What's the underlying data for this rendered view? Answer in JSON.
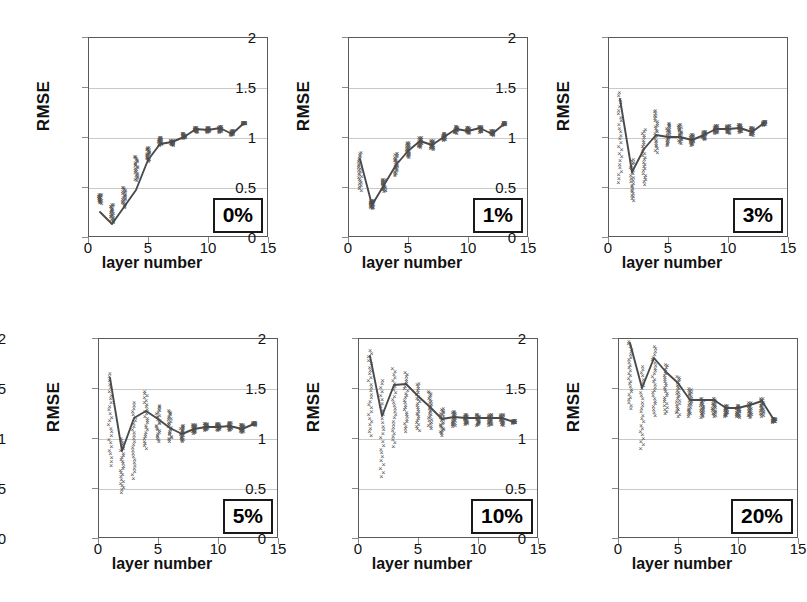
{
  "figure": {
    "axis_titles": {
      "y": "RMSE",
      "x": "layer number"
    },
    "y_ticks": [
      "0",
      "0.5",
      "1",
      "1.5",
      "2"
    ],
    "x_ticks": [
      "0",
      "5",
      "10",
      "15"
    ],
    "colors": {
      "frame": "#5a5a5a",
      "grid": "#c9c9c9",
      "marker": "#555555",
      "line": "#4a4a4a",
      "badge_border": "#1a1a1a"
    }
  },
  "chart_data": [
    {
      "type": "scatter",
      "title": "0%",
      "xlabel": "layer number",
      "ylabel": "RMSE",
      "xlim": [
        0,
        15
      ],
      "ylim": [
        0,
        2
      ],
      "xticks": [
        0,
        5,
        10,
        15
      ],
      "yticks": [
        0,
        0.5,
        1,
        1.5,
        2
      ],
      "grid": true,
      "legend": "none",
      "x": [
        1,
        2,
        3,
        4,
        5,
        6,
        7,
        8,
        9,
        10,
        11,
        12,
        13
      ],
      "mean_values": [
        0.25,
        0.13,
        0.3,
        0.47,
        0.77,
        0.93,
        0.95,
        1.0,
        1.08,
        1.07,
        1.09,
        1.03,
        1.14
      ],
      "spread_low": [
        0.34,
        0.15,
        0.3,
        0.57,
        0.76,
        0.92,
        0.92,
        0.99,
        1.05,
        1.05,
        1.05,
        1.02,
        1.13
      ],
      "spread_high": [
        0.43,
        0.33,
        0.5,
        0.81,
        0.9,
        1.0,
        0.97,
        1.04,
        1.1,
        1.1,
        1.11,
        1.07,
        1.15
      ]
    },
    {
      "type": "scatter",
      "title": "1%",
      "xlabel": "layer number",
      "ylabel": "RMSE",
      "xlim": [
        0,
        15
      ],
      "ylim": [
        0,
        2
      ],
      "xticks": [
        0,
        5,
        10,
        15
      ],
      "yticks": [
        0,
        0.5,
        1,
        1.5,
        2
      ],
      "grid": true,
      "legend": "none",
      "x": [
        1,
        2,
        3,
        4,
        5,
        6,
        7,
        8,
        9,
        10,
        11,
        12,
        13
      ],
      "mean_values": [
        0.78,
        0.32,
        0.52,
        0.72,
        0.86,
        0.96,
        0.92,
        1.0,
        1.08,
        1.06,
        1.09,
        1.03,
        1.13
      ],
      "spread_low": [
        0.47,
        0.29,
        0.46,
        0.62,
        0.8,
        0.9,
        0.88,
        0.97,
        1.04,
        1.04,
        1.05,
        1.02,
        1.12
      ],
      "spread_high": [
        0.85,
        0.37,
        0.58,
        0.84,
        0.95,
        1.0,
        0.97,
        1.04,
        1.11,
        1.1,
        1.11,
        1.07,
        1.15
      ]
    },
    {
      "type": "scatter",
      "title": "3%",
      "xlabel": "layer number",
      "ylabel": "RMSE",
      "xlim": [
        0,
        15
      ],
      "ylim": [
        0,
        2
      ],
      "xticks": [
        0,
        5,
        10,
        15
      ],
      "yticks": [
        0,
        0.5,
        1,
        1.5,
        2
      ],
      "grid": true,
      "legend": "none",
      "x": [
        1,
        2,
        3,
        4,
        5,
        6,
        7,
        8,
        9,
        10,
        11,
        12,
        13
      ],
      "mean_values": [
        1.38,
        0.65,
        0.88,
        1.02,
        1.0,
        1.0,
        0.97,
        1.02,
        1.08,
        1.08,
        1.09,
        1.05,
        1.14
      ],
      "spread_low": [
        0.55,
        0.37,
        0.53,
        0.85,
        0.92,
        0.94,
        0.92,
        0.98,
        1.04,
        1.04,
        1.05,
        1.02,
        1.12
      ],
      "spread_high": [
        1.45,
        0.78,
        1.08,
        1.27,
        1.14,
        1.13,
        1.03,
        1.06,
        1.12,
        1.12,
        1.13,
        1.1,
        1.16
      ]
    },
    {
      "type": "scatter",
      "title": "5%",
      "xlabel": "layer number",
      "ylabel": "RMSE",
      "xlim": [
        0,
        15
      ],
      "ylim": [
        0,
        2
      ],
      "xticks": [
        0,
        5,
        10,
        15
      ],
      "yticks": [
        0,
        0.5,
        1,
        1.5,
        2
      ],
      "grid": true,
      "legend": "none",
      "x": [
        1,
        2,
        3,
        4,
        5,
        6,
        7,
        8,
        9,
        10,
        11,
        12,
        13
      ],
      "mean_values": [
        1.6,
        0.87,
        1.2,
        1.27,
        1.19,
        1.1,
        1.04,
        1.09,
        1.11,
        1.11,
        1.12,
        1.09,
        1.14
      ],
      "spread_low": [
        0.73,
        0.46,
        0.6,
        0.9,
        0.97,
        0.97,
        0.97,
        1.05,
        1.08,
        1.08,
        1.08,
        1.06,
        1.13
      ],
      "spread_high": [
        1.65,
        1.0,
        1.36,
        1.47,
        1.33,
        1.28,
        1.13,
        1.14,
        1.15,
        1.15,
        1.16,
        1.14,
        1.16
      ]
    },
    {
      "type": "scatter",
      "title": "10%",
      "xlabel": "layer number",
      "ylabel": "RMSE",
      "xlim": [
        0,
        15
      ],
      "ylim": [
        0,
        2
      ],
      "xticks": [
        0,
        5,
        10,
        15
      ],
      "yticks": [
        0,
        0.5,
        1,
        1.5,
        2
      ],
      "grid": true,
      "legend": "none",
      "x": [
        1,
        2,
        3,
        4,
        5,
        6,
        7,
        8,
        9,
        10,
        11,
        12,
        13
      ],
      "mean_values": [
        1.82,
        1.22,
        1.53,
        1.54,
        1.42,
        1.31,
        1.19,
        1.21,
        1.2,
        1.2,
        1.2,
        1.2,
        1.16
      ],
      "spread_low": [
        1.03,
        0.62,
        0.92,
        1.07,
        1.08,
        1.1,
        1.03,
        1.12,
        1.14,
        1.13,
        1.13,
        1.13,
        1.15
      ],
      "spread_high": [
        1.88,
        1.58,
        1.7,
        1.66,
        1.55,
        1.47,
        1.3,
        1.27,
        1.24,
        1.24,
        1.24,
        1.24,
        1.18
      ]
    },
    {
      "type": "scatter",
      "title": "20%",
      "xlabel": "layer number",
      "ylabel": "RMSE",
      "xlim": [
        0,
        15
      ],
      "ylim": [
        0,
        2
      ],
      "xticks": [
        0,
        5,
        10,
        15
      ],
      "yticks": [
        0,
        0.5,
        1,
        1.5,
        2
      ],
      "grid": true,
      "legend": "none",
      "x": [
        1,
        2,
        3,
        4,
        5,
        6,
        7,
        8,
        9,
        10,
        11,
        12,
        13
      ],
      "mean_values": [
        1.95,
        1.5,
        1.8,
        1.66,
        1.55,
        1.38,
        1.38,
        1.38,
        1.3,
        1.3,
        1.33,
        1.37,
        1.18
      ],
      "spread_low": [
        1.3,
        0.9,
        1.23,
        1.25,
        1.22,
        1.22,
        1.21,
        1.22,
        1.22,
        1.21,
        1.21,
        1.22,
        1.16
      ],
      "spread_high": [
        1.97,
        1.72,
        1.92,
        1.74,
        1.62,
        1.5,
        1.4,
        1.4,
        1.33,
        1.33,
        1.36,
        1.4,
        1.2
      ]
    }
  ]
}
